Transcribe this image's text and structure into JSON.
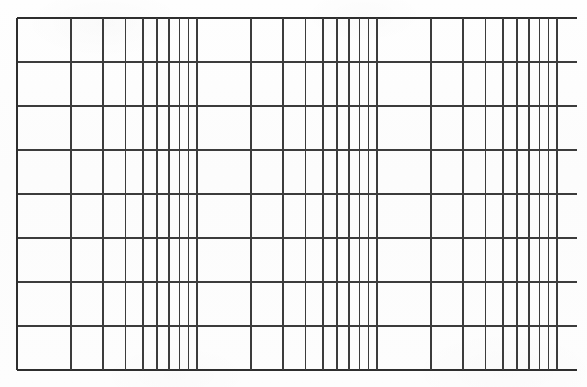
{
  "document": {
    "kind": "semi-log-graph-paper",
    "title": "Semi-logarithmic graph paper",
    "orientation": "landscape",
    "background_color": "#fdfdfd",
    "line_color": "#3c3c3c",
    "border_color": "#2e2e2e"
  },
  "chart_data": {
    "type": "table",
    "xlabel": "",
    "ylabel": "",
    "grid": true,
    "legend": false,
    "x_axis": {
      "scale": "log",
      "decades": 3,
      "decade_start_px": [
        17,
        197,
        377,
        557
      ],
      "decade_width_px": 180,
      "mantissa_ticks": [
        1,
        2,
        3,
        4,
        5,
        6,
        7,
        8,
        9
      ],
      "plot_left_px": 17,
      "plot_right_px": 567,
      "tick_count": 28,
      "tick_positions_px": [
        17,
        71.2,
        102.9,
        125.4,
        142.8,
        157.0,
        169.0,
        179.4,
        188.6,
        197,
        251.2,
        282.9,
        305.4,
        322.8,
        337.0,
        349.0,
        359.4,
        368.6,
        377,
        431.2,
        462.9,
        485.4,
        502.8,
        517.0,
        529.0,
        539.4,
        548.6,
        557
      ]
    },
    "y_axis": {
      "scale": "linear",
      "divisions": 8,
      "line_count": 9,
      "top_px": 18,
      "bottom_px": 370,
      "spacing_px": 44,
      "tick_positions_px": [
        18,
        62,
        106,
        150,
        194,
        238,
        282,
        326,
        370
      ]
    },
    "categories": [],
    "values": [],
    "series": []
  },
  "grid": {
    "major_stroke_width": 2.0,
    "minor_stroke_width": 1.6,
    "horizontal_stroke_width": 2.0,
    "horizontal_overhang_left_px": 0,
    "horizontal_overhang_right_px": 10
  }
}
